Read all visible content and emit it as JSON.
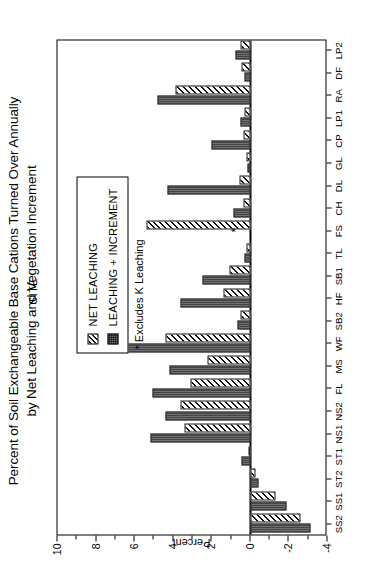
{
  "chart_data": {
    "type": "bar",
    "orientation": "vertical",
    "title": "Percent of Soil Exchangeable Base Cations Turned Over Annually by Net Leaching and Vegetation Increment",
    "title_lines": [
      "Percent of Soil Exchangeable Base Cations Turned Over Annually",
      "by Net Leaching and Vegetation Increment"
    ],
    "xlabel": "SITE",
    "ylabel": "Percent",
    "ylim": [
      -4,
      10
    ],
    "yticks": [
      10,
      8,
      6,
      4,
      2,
      0,
      -2,
      -4
    ],
    "ytick_labels": [
      "10",
      "8",
      "6",
      "4",
      "2",
      "0",
      "-2",
      "-4"
    ],
    "grid": false,
    "legend_position": "upper-right-inside",
    "categories": [
      "SS2",
      "SS1",
      "ST2",
      "ST1",
      "NS1",
      "NS2",
      "FL",
      "MS",
      "WF",
      "SB2",
      "HF",
      "SB1",
      "TL",
      "FS",
      "CH",
      "DL",
      "GL",
      "CP",
      "LP1",
      "RA",
      "DF",
      "LP2"
    ],
    "series": [
      {
        "name": "NET LEACHING",
        "pattern": "diagonal-hatch",
        "values": [
          -2.6,
          -1.3,
          -0.25,
          0.1,
          3.4,
          3.6,
          3.1,
          2.2,
          4.4,
          0.5,
          1.4,
          1.1,
          0.2,
          5.4,
          0.35,
          0.55,
          0.2,
          0.35,
          0.3,
          3.9,
          0.45,
          0.5
        ]
      },
      {
        "name": "LEACHING + INCREMENT",
        "pattern": "stipple-dark",
        "values": [
          -3.1,
          -1.9,
          -0.4,
          0.45,
          5.2,
          4.4,
          5.1,
          4.2,
          7.2,
          0.65,
          3.6,
          2.5,
          0.3,
          0.0,
          0.9,
          4.3,
          0.15,
          2.0,
          0.5,
          4.8,
          0.3,
          0.75
        ]
      }
    ],
    "annotations": [
      {
        "text": "*",
        "category": "FS",
        "value": 0.75,
        "note": "Excludes K Leaching"
      }
    ],
    "footnote": "* Excludes K Leaching"
  },
  "legend": {
    "items": [
      {
        "label": "NET LEACHING",
        "swatch": "hatch-swatch"
      },
      {
        "label": "LEACHING + INCREMENT",
        "swatch": "stipple-swatch"
      }
    ]
  }
}
